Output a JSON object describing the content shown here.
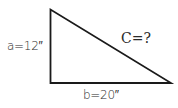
{
  "diagram": {
    "type": "right-triangle",
    "labels": {
      "side_a": "a=12″",
      "side_b": "b=20″",
      "hypotenuse": "C=?"
    },
    "values": {
      "a": 12,
      "b": 20,
      "c": "?"
    },
    "units": "inches",
    "colors": {
      "stroke": "#1a1a1a",
      "text": "#2a2a2a",
      "background": "#ffffff"
    }
  }
}
